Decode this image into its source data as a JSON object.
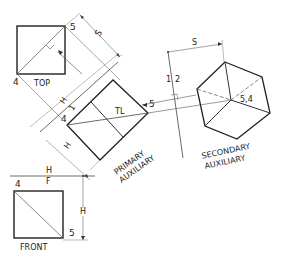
{
  "diagram": {
    "title": "",
    "views": {
      "top": {
        "label": "TOP",
        "point_a": "5",
        "point_b": "4"
      },
      "front": {
        "label": "FRONT",
        "point_a": "4",
        "point_b": "5"
      },
      "primary_auxiliary": {
        "label_line1": "PRIMARY",
        "label_line2": "AUXILIARY",
        "point_a": "4",
        "point_b": "5",
        "true_length": "TL"
      },
      "secondary_auxiliary": {
        "label_line1": "SECONDARY",
        "label_line2": "AUXILIARY",
        "point_label": "5,4"
      }
    },
    "fold_lines": {
      "hf_top": "H",
      "hf_bottom": "F",
      "h1_top": "H",
      "h1_bottom": "1",
      "f12_left": "1",
      "f12_right": "2"
    },
    "dimensions": {
      "top_s": "S",
      "secondary_s": "S",
      "primary_h": "H",
      "front_h": "H"
    },
    "colors": {
      "line": "#2a2a2a",
      "thin": "#555555",
      "background": "#ffffff"
    }
  }
}
